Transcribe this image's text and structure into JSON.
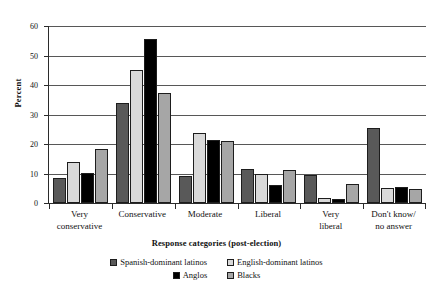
{
  "chart_data": {
    "type": "bar",
    "title": "",
    "xlabel": "Response categories (post-election)",
    "ylabel": "Percent",
    "ylim": [
      0,
      60
    ],
    "yticks": [
      0,
      10,
      20,
      30,
      40,
      50,
      60
    ],
    "grid": "horizontal",
    "legend_position": "bottom",
    "categories": [
      "Very\nconservative",
      "Conservative",
      "Moderate",
      "Liberal",
      "Very\nliberal",
      "Don't know/\nno answer"
    ],
    "category_lines": [
      [
        "Very",
        "conservative"
      ],
      [
        "Conservative",
        ""
      ],
      [
        "Moderate",
        ""
      ],
      [
        "Liberal",
        ""
      ],
      [
        "Very",
        "liberal"
      ],
      [
        "Don't know/",
        "no answer"
      ]
    ],
    "series": [
      {
        "name": "Spanish-dominant latinos",
        "color": "#595959",
        "values": [
          8.4,
          34.0,
          9.3,
          11.5,
          9.6,
          25.4
        ]
      },
      {
        "name": "English-dominant latinos",
        "color": "#d9d9d9",
        "values": [
          14.0,
          45.0,
          23.7,
          9.8,
          1.8,
          5.1
        ]
      },
      {
        "name": "Anglos",
        "color": "#000000",
        "values": [
          10.1,
          55.5,
          21.5,
          6.0,
          1.4,
          5.4
        ]
      },
      {
        "name": "Blacks",
        "color": "#a6a6a6",
        "values": [
          18.3,
          37.4,
          21.0,
          11.3,
          6.4,
          4.8
        ]
      }
    ]
  },
  "axis": {
    "y_tick_labels": [
      "0",
      "10",
      "20",
      "30",
      "40",
      "50",
      "60"
    ]
  }
}
